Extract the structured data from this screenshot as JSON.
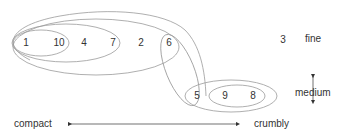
{
  "diagram": {
    "type": "nested-cluster-diagram",
    "colors": {
      "stroke": "#9a9a9a",
      "text": "#333333",
      "arrow": "#333333"
    },
    "items": [
      {
        "id": "1",
        "label": "1"
      },
      {
        "id": "10",
        "label": "10"
      },
      {
        "id": "4",
        "label": "4"
      },
      {
        "id": "7",
        "label": "7"
      },
      {
        "id": "2",
        "label": "2"
      },
      {
        "id": "6",
        "label": "6"
      },
      {
        "id": "5",
        "label": "5"
      },
      {
        "id": "9",
        "label": "9"
      },
      {
        "id": "8",
        "label": "8"
      },
      {
        "id": "3",
        "label": "3"
      }
    ],
    "clusters": [
      {
        "members": [
          "1",
          "10"
        ]
      },
      {
        "members": [
          "1",
          "10",
          "4",
          "7"
        ]
      },
      {
        "members": [
          "1",
          "10",
          "4",
          "7",
          "2",
          "6"
        ]
      },
      {
        "members": [
          "1",
          "10",
          "4",
          "7",
          "2",
          "6",
          "5"
        ]
      },
      {
        "members": [
          "6",
          "5"
        ]
      },
      {
        "members": [
          "9",
          "8"
        ]
      },
      {
        "members": [
          "5",
          "9",
          "8"
        ]
      }
    ],
    "horizontal_axis": {
      "left_label": "compact",
      "right_label": "crumbly"
    },
    "vertical_axis": {
      "top_label": "fine",
      "bottom_label": "medium"
    }
  }
}
